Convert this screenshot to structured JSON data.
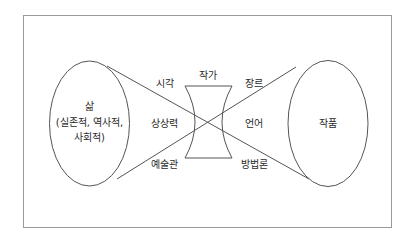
{
  "diagram": {
    "left_node": {
      "title": "삶",
      "subtitle_line1": "(실존적, 역사적,",
      "subtitle_line2": "사회적)"
    },
    "right_node": {
      "title": "작품"
    },
    "center_node": {
      "title": "작가"
    },
    "labels": {
      "top_left": "시각",
      "middle_left": "상상력",
      "bottom_left": "예술관",
      "top_right": "장르",
      "middle_right": "언어",
      "bottom_right": "방법론"
    },
    "colors": {
      "line": "#555555",
      "frame": "#9a9a9a",
      "text": "#2a2a2a"
    }
  }
}
